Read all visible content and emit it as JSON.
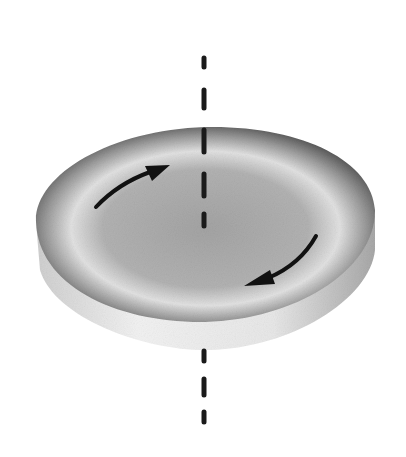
{
  "figure": {
    "colors": {
      "background": "#ffffff",
      "axis": "#1a1a1a",
      "arrow": "#111111",
      "disc_dark": "#5a5a5a",
      "disc_mid": "#9a9a9a",
      "disc_light": "#e6e6e6",
      "rim_light": "#f0f0f0",
      "rim_dark": "#bdbdbd"
    },
    "arrows": [
      {
        "name": "upper-left-arrow",
        "direction": "clockwise"
      },
      {
        "name": "lower-right-arrow",
        "direction": "clockwise"
      }
    ]
  }
}
